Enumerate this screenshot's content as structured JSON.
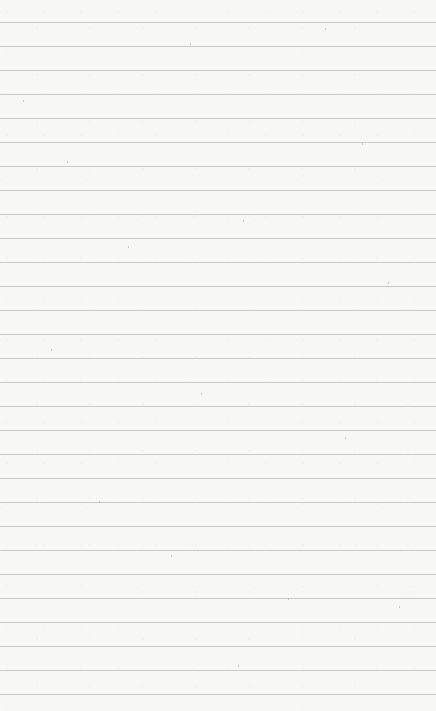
{
  "paper": {
    "background_color": "#f7f7f5",
    "line_color": "#c9c9c7",
    "first_line_y": 22,
    "line_spacing": 24,
    "line_count": 29
  }
}
